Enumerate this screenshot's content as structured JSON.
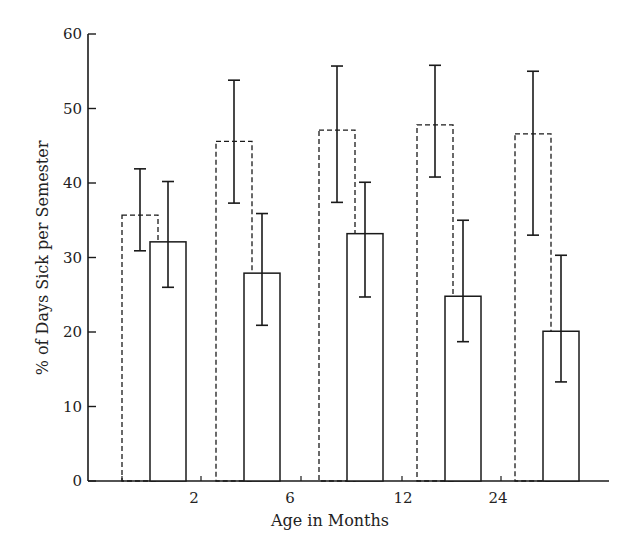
{
  "chart_data": {
    "type": "bar",
    "title": "",
    "xlabel": "Age in Months",
    "ylabel": "% of Days Sick per Semester",
    "ylim": [
      0,
      60
    ],
    "yticks": [
      0,
      10,
      20,
      30,
      40,
      50,
      60
    ],
    "xtick_labels": [
      "2",
      "6",
      "12",
      "24"
    ],
    "grid": false,
    "legend": null,
    "bar_styles": {
      "series_a": "dashed outline",
      "series_b": "solid outline"
    },
    "groups": 5,
    "series": [
      {
        "name": "Dashed bars",
        "style": "dashed",
        "values": [
          35.7,
          45.6,
          47.1,
          47.8,
          46.6
        ],
        "error_low": [
          30.9,
          37.3,
          37.4,
          40.8,
          33.0
        ],
        "error_high": [
          41.9,
          53.8,
          55.7,
          55.8,
          55.0
        ]
      },
      {
        "name": "Solid bars",
        "style": "solid",
        "values": [
          32.1,
          27.9,
          33.2,
          24.8,
          20.1
        ],
        "error_low": [
          26.0,
          20.9,
          24.7,
          18.7,
          13.3
        ],
        "error_high": [
          40.2,
          35.9,
          40.1,
          35.0,
          30.3
        ]
      }
    ]
  }
}
